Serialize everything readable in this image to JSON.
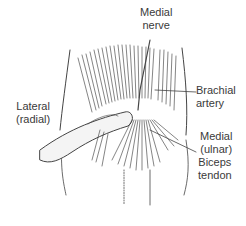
{
  "figure": {
    "type": "anatomical-illustration",
    "labels": [
      {
        "id": "medial-nerve",
        "lines": [
          "Medial",
          "nerve"
        ]
      },
      {
        "id": "brachial-artery",
        "lines": [
          "Brachial",
          "artery"
        ]
      },
      {
        "id": "lateral-radial",
        "lines": [
          "Lateral",
          "(radial)"
        ]
      },
      {
        "id": "medial-ulnar",
        "lines": [
          "Medial",
          "(ulnar)"
        ]
      },
      {
        "id": "biceps-tendon",
        "lines": [
          "Biceps",
          "tendon"
        ]
      }
    ]
  }
}
